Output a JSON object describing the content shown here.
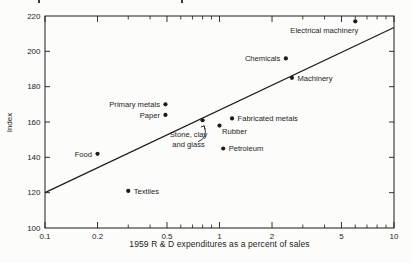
{
  "figure": {
    "background": "#fcfcfa",
    "ink": "#1c1c1a"
  },
  "chart_data": {
    "type": "scatter",
    "title": "",
    "xlabel": "1959 R & D expenditures as a percent of sales",
    "ylabel": "Index",
    "x_scale": "log",
    "x_range": [
      0.1,
      10
    ],
    "y_range": [
      100,
      220
    ],
    "x_major_ticks": [
      0.1,
      0.2,
      0.5,
      1,
      2,
      5,
      10
    ],
    "x_major_tick_labels": [
      "0.1",
      "0.2",
      "0.5",
      "1",
      "2",
      "5",
      "10"
    ],
    "x_minor_ticks": [
      0.3,
      0.4,
      0.6,
      0.7,
      0.8,
      0.9,
      3,
      4,
      6,
      7,
      8,
      9
    ],
    "y_ticks": [
      100,
      120,
      140,
      160,
      180,
      200,
      220
    ],
    "y_tick_labels": [
      "100",
      "120",
      "140",
      "160",
      "180",
      "200",
      "220"
    ],
    "grid": false,
    "legend": false,
    "point_color": "#1c1c1a",
    "line_color": "#1c1c1a",
    "points": [
      {
        "label": "Electrical machinery",
        "x": 6.0,
        "y": 217,
        "label_side": "below-left"
      },
      {
        "label": "Chemicals",
        "x": 2.4,
        "y": 196,
        "label_side": "left"
      },
      {
        "label": "Machinery",
        "x": 2.6,
        "y": 185,
        "label_side": "right"
      },
      {
        "label": "Primary metals",
        "x": 0.49,
        "y": 170,
        "label_side": "left"
      },
      {
        "label": "Paper",
        "x": 0.49,
        "y": 164,
        "label_side": "left"
      },
      {
        "label": "Fabricated metals",
        "x": 1.18,
        "y": 162,
        "label_side": "right"
      },
      {
        "label": "Stone, clay and glass",
        "x": 0.8,
        "y": 161,
        "label_side": "callout",
        "label_lines": [
          "Stone, clay",
          "and glass"
        ]
      },
      {
        "label": "Rubber",
        "x": 1.0,
        "y": 158,
        "label_side": "below-right"
      },
      {
        "label": "Petroleum",
        "x": 1.05,
        "y": 145,
        "label_side": "right"
      },
      {
        "label": "Food",
        "x": 0.2,
        "y": 142,
        "label_side": "left"
      },
      {
        "label": "Textiles",
        "x": 0.3,
        "y": 121,
        "label_side": "right"
      }
    ],
    "trend_line": {
      "from": {
        "x": 0.1,
        "y": 120
      },
      "to": {
        "x": 10,
        "y": 213.5
      }
    }
  }
}
